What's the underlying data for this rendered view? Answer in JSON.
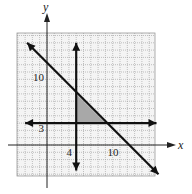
{
  "chart_data": {
    "type": "line",
    "title": "",
    "xlabel": "x",
    "ylabel": "y",
    "xlim": [
      -4,
      15
    ],
    "ylim": [
      -4,
      15
    ],
    "grid": true,
    "tick_labels": {
      "x": [
        {
          "value": 4,
          "label": "4"
        },
        {
          "value": 10,
          "label": "10"
        }
      ],
      "y": [
        {
          "value": 3,
          "label": "3"
        },
        {
          "value": 10,
          "label": "10"
        }
      ]
    },
    "lines": [
      {
        "name": "x + y = 11",
        "type": "diagonal",
        "points": [
          [
            -3,
            14
          ],
          [
            15,
            -4
          ]
        ]
      },
      {
        "name": "x = 4",
        "type": "vertical",
        "x": 4,
        "y_range": [
          -3.5,
          14
        ]
      },
      {
        "name": "y = 3",
        "type": "horizontal",
        "y": 3,
        "x_range": [
          -3,
          15
        ]
      }
    ],
    "shaded_region": {
      "name": "feasible-region",
      "vertices": [
        [
          4,
          3
        ],
        [
          4,
          7
        ],
        [
          8,
          3
        ]
      ],
      "color": "#a8a8a8"
    },
    "colors": {
      "grid": "#9a9a9a",
      "line": "#111111",
      "shade": "#a8a8a8"
    }
  }
}
